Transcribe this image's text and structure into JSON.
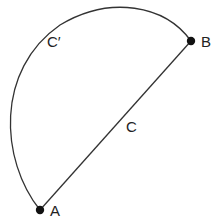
{
  "diagram": {
    "type": "geometry",
    "colors": {
      "stroke": "#333333",
      "point": "#111111",
      "background": "#ffffff"
    },
    "points": [
      {
        "id": "A",
        "label": "A",
        "x": 40,
        "y": 210
      },
      {
        "id": "B",
        "label": "B",
        "x": 191,
        "y": 41
      }
    ],
    "paths": [
      {
        "id": "C",
        "label": "C",
        "kind": "straight-line",
        "from": "A",
        "to": "B"
      },
      {
        "id": "C-prime",
        "label": "C′",
        "kind": "arc",
        "from": "A",
        "to": "B"
      }
    ],
    "labels": {
      "A": "A",
      "B": "B",
      "C": "C",
      "C_prime": "C′"
    }
  }
}
